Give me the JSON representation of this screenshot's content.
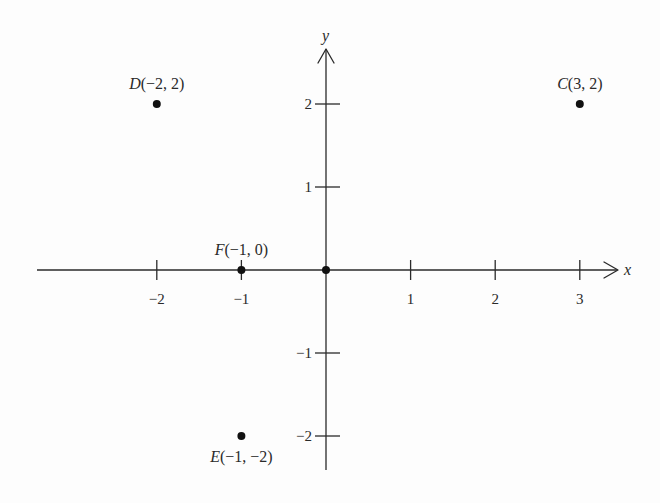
{
  "diagram": {
    "type": "coordinate-plane",
    "x_axis": {
      "name": "x",
      "ticks": [
        {
          "value": -2,
          "label": "−2"
        },
        {
          "value": -1,
          "label": "−1"
        },
        {
          "value": 1,
          "label": "1"
        },
        {
          "value": 2,
          "label": "2"
        },
        {
          "value": 3,
          "label": "3"
        }
      ]
    },
    "y_axis": {
      "name": "y",
      "ticks": [
        {
          "value": 2,
          "label": "2"
        },
        {
          "value": 1,
          "label": "1"
        },
        {
          "value": -1,
          "label": "−1"
        },
        {
          "value": -2,
          "label": "−2"
        }
      ]
    },
    "origin_point": {
      "x": 0,
      "y": 0
    },
    "points": [
      {
        "id": "C",
        "name": "C",
        "coords": "(3, 2)",
        "x": 3,
        "y": 2,
        "label_pos": "above"
      },
      {
        "id": "D",
        "name": "D",
        "coords": "(−2, 2)",
        "x": -2,
        "y": 2,
        "label_pos": "above"
      },
      {
        "id": "E",
        "name": "E",
        "coords": "(−1, −2)",
        "x": -1,
        "y": -2,
        "label_pos": "below"
      },
      {
        "id": "F",
        "name": "F",
        "coords": "(−1, 0)",
        "x": -1,
        "y": 0,
        "label_pos": "above"
      }
    ]
  }
}
